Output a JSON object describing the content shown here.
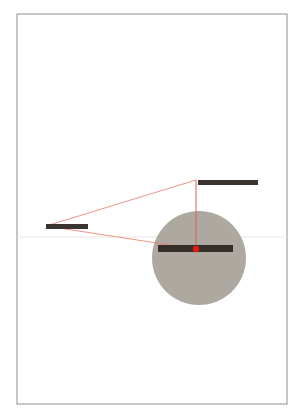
{
  "canvas": {
    "width": 301,
    "height": 420,
    "background_color": "#ffffff"
  },
  "frame": {
    "label": "page-border",
    "x": 17,
    "y": 14,
    "width": 270,
    "height": 390,
    "stroke_color": "#8e8e8e",
    "stroke_width": 1,
    "fill_color": "#ffffff"
  },
  "reference_line": {
    "label": "horizontal-axis",
    "x1": 17,
    "y1": 237,
    "x2": 287,
    "y2": 237,
    "stroke_color": "#ece4e2",
    "stroke_width": 1
  },
  "circle": {
    "label": "gray-disc",
    "cx": 199,
    "cy": 258,
    "r": 47,
    "fill_color": "#ada8a0"
  },
  "bars": [
    {
      "name": "top-right-bar",
      "x": 198,
      "y": 180,
      "width": 60,
      "height": 5,
      "color": "#3a3330"
    },
    {
      "name": "left-bar",
      "x": 46,
      "y": 224,
      "width": 42,
      "height": 5,
      "color": "#3a3330"
    },
    {
      "name": "center-bar",
      "x": 158,
      "y": 245,
      "width": 75,
      "height": 7,
      "color": "#342d2a"
    }
  ],
  "construction_lines": {
    "stroke_color": "#e8796a",
    "stroke_width": 0.8,
    "apex": {
      "x": 46,
      "y": 226
    },
    "segments": [
      {
        "name": "upper-ray",
        "x1": 46,
        "y1": 226,
        "x2": 196,
        "y2": 180
      },
      {
        "name": "lower-ray",
        "x1": 46,
        "y1": 226,
        "x2": 196,
        "y2": 249
      },
      {
        "name": "closing-edge",
        "x1": 196,
        "y1": 180,
        "x2": 196,
        "y2": 249
      }
    ]
  },
  "vertical_drop": {
    "name": "plumb-line",
    "x1": 196,
    "y1": 180,
    "x2": 196,
    "y2": 249,
    "stroke_color": "#d9604f",
    "stroke_width": 1
  },
  "marker": {
    "name": "focus-point",
    "cx": 196,
    "cy": 249,
    "r": 3.2,
    "fill_color": "#e01b10"
  }
}
